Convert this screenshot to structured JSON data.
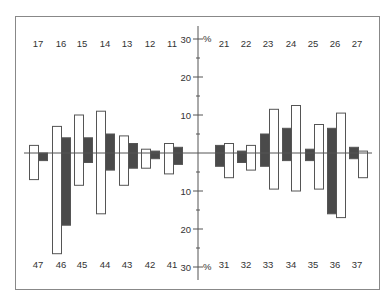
{
  "chart_data": {
    "type": "bar",
    "title": "",
    "xlabel": "",
    "ylabel": "%",
    "ylim": [
      -30,
      30
    ],
    "yticks_major": [
      30,
      20,
      10,
      10,
      20,
      30
    ],
    "y_axis_labels_upper": [
      "30",
      "20",
      "10"
    ],
    "y_axis_labels_lower": [
      "10",
      "20",
      "30"
    ],
    "unit_label": "%",
    "grid": false,
    "legend": null,
    "colors": {
      "white_bar": "#ffffff",
      "dark_bar": "#4a4a4a",
      "stroke": "#555555",
      "frame": "#888888"
    },
    "quadrants": {
      "upper_right": {
        "label_row": "top",
        "teeth": [
          "17",
          "16",
          "15",
          "14",
          "13",
          "12",
          "11"
        ]
      },
      "upper_left": {
        "label_row": "top",
        "teeth": [
          "21",
          "22",
          "23",
          "24",
          "25",
          "26",
          "27"
        ]
      },
      "lower_right": {
        "label_row": "bottom",
        "teeth": [
          "47",
          "46",
          "45",
          "44",
          "43",
          "42",
          "41"
        ]
      },
      "lower_left": {
        "label_row": "bottom",
        "teeth": [
          "31",
          "32",
          "33",
          "34",
          "35",
          "36",
          "37"
        ]
      }
    },
    "series": [
      {
        "name": "white",
        "side": "left_of_pair_on_left_half, right_of_pair_on_right_half",
        "upper_values": {
          "17": 2,
          "16": 7,
          "15": 10,
          "14": 11,
          "13": 4.5,
          "12": 1,
          "11": 2.5,
          "21": 2.5,
          "22": 2,
          "23": 11.5,
          "24": 12.5,
          "25": 7.5,
          "26": 10.5,
          "27": 0.5
        },
        "lower_values": {
          "47": 7,
          "46": 26.5,
          "45": 8.5,
          "44": 16,
          "43": 8.5,
          "42": 4,
          "41": 5.5,
          "31": 6.5,
          "32": 4.5,
          "33": 9.5,
          "34": 10,
          "35": 9.5,
          "36": 17,
          "37": 6.5
        }
      },
      {
        "name": "dark",
        "side": "right_of_pair_on_left_half, left_of_pair_on_right_half",
        "upper_values": {
          "17": 0,
          "16": 4,
          "15": 4,
          "14": 5,
          "13": 2.5,
          "12": 0.5,
          "11": 1.5,
          "21": 2,
          "22": 0.5,
          "23": 5,
          "24": 6.5,
          "25": 1,
          "26": 6.5,
          "27": 1.5
        },
        "lower_values": {
          "47": 2,
          "46": 19,
          "45": 2.5,
          "44": 4.5,
          "43": 4,
          "42": 1.5,
          "41": 3,
          "31": 3.5,
          "32": 2.5,
          "33": 3.5,
          "34": 2,
          "35": 2,
          "36": 16,
          "37": 1.5
        }
      }
    ]
  }
}
